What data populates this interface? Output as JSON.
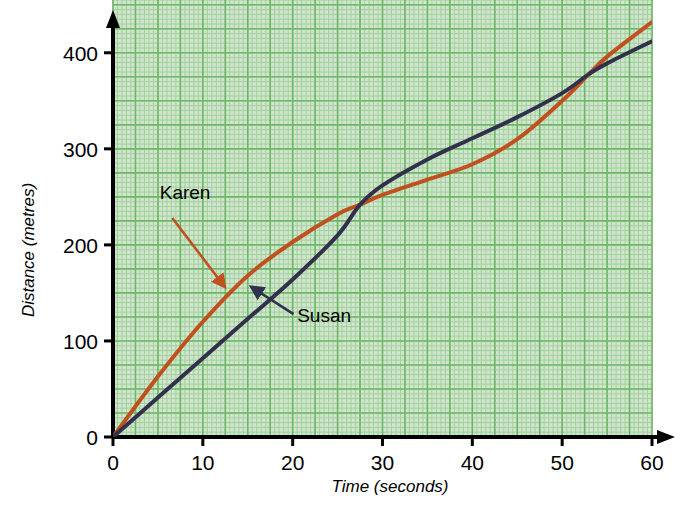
{
  "chart_data": {
    "type": "line",
    "title": "",
    "xlabel": "Time (seconds)",
    "ylabel": "Distance (metres)",
    "xlim": [
      0,
      60
    ],
    "ylim": [
      0,
      450
    ],
    "xticks": [
      0,
      10,
      20,
      30,
      40,
      50,
      60
    ],
    "yticks": [
      0,
      100,
      200,
      300,
      400
    ],
    "xtick_labels": [
      "0",
      "10",
      "20",
      "30",
      "40",
      "50",
      "60"
    ],
    "ytick_labels": [
      "0",
      "100",
      "200",
      "300",
      "400"
    ],
    "grid": true,
    "grid_major_step_x": 2.5,
    "grid_minor_step_x": 0.5,
    "grid_major_step_y": 25,
    "grid_minor_step_y": 5,
    "legend": "annotated-labels",
    "series": [
      {
        "name": "Karen",
        "color": "#c0511e",
        "x": [
          0,
          5,
          10,
          15,
          20,
          25,
          27.5,
          30,
          35,
          40,
          45,
          50,
          53,
          55,
          60
        ],
        "values": [
          0,
          63,
          120,
          168,
          203,
          232,
          242,
          252,
          268,
          284,
          310,
          350,
          378,
          396,
          432
        ]
      },
      {
        "name": "Susan",
        "color": "#33304d",
        "x": [
          0,
          5,
          10,
          15,
          20,
          25,
          27.5,
          30,
          35,
          40,
          45,
          50,
          53,
          55,
          60
        ],
        "values": [
          0,
          41,
          82,
          123,
          164,
          210,
          242,
          262,
          289,
          311,
          333,
          358,
          378,
          389,
          412
        ]
      }
    ],
    "annotations": [
      {
        "text": "Karen",
        "color": "#c0511e",
        "label_x": 5.2,
        "label_y": 248,
        "arrow_from_x": 6.6,
        "arrow_from_y": 228,
        "arrow_to_x": 12.3,
        "arrow_to_y": 158
      },
      {
        "text": "Susan",
        "color": "#33304d",
        "label_x": 20.5,
        "label_y": 120,
        "arrow_from_x": 20.1,
        "arrow_from_y": 128,
        "arrow_to_x": 15.6,
        "arrow_to_y": 155
      }
    ],
    "colors": {
      "plot_background": "#cfe5cc",
      "grid_minor": "#a5cfa0",
      "grid_major": "#6db866",
      "axis": "#000000",
      "karen": "#c0511e",
      "susan": "#33304d"
    }
  }
}
